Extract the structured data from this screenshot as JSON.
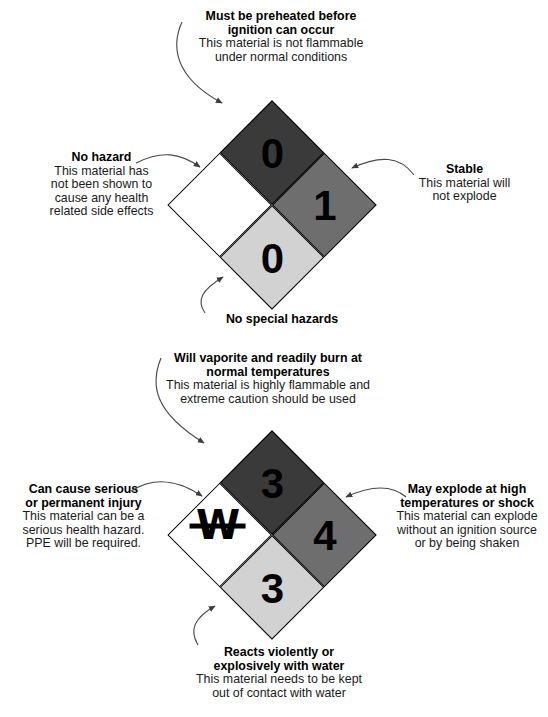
{
  "page": {
    "background_color": "#ffffff",
    "width": 548,
    "height": 717
  },
  "palette": {
    "health_quadrant": "#3a3a3a",
    "flammability_quadrant": "#6e6e6e",
    "reactivity_quadrant": "#d2d2d2",
    "special_quadrant": "#ffffff",
    "border": "#000000",
    "rating_text": "#000000",
    "body_text": "#1a1a1a",
    "arrow_stroke": "#4a4a4a"
  },
  "diagrams": [
    {
      "id": "diamond-upper",
      "name": "low-hazard-example",
      "quadrants": {
        "flammability": {
          "rating": "1",
          "color": "#6e6e6e",
          "position": "top"
        },
        "health": {
          "rating": "0",
          "color": "#3a3a3a",
          "position": "left"
        },
        "reactivity": {
          "rating": "0",
          "color": "#d2d2d2",
          "position": "right"
        },
        "special": {
          "symbol": "",
          "color": "#ffffff",
          "position": "bottom"
        }
      },
      "callouts": {
        "top": {
          "headline": [
            "Must be preheated before",
            "ignition can occur"
          ],
          "description": [
            "This material is not flammable",
            "under normal conditions"
          ]
        },
        "left": {
          "headline": [
            "No hazard"
          ],
          "description": [
            "This material has",
            "not been shown to",
            "cause any health",
            "related side effects"
          ]
        },
        "right": {
          "headline": [
            "Stable"
          ],
          "description": [
            "This material will",
            "not explode"
          ]
        },
        "bottom": {
          "headline": [
            "No special hazards"
          ],
          "description": []
        }
      }
    },
    {
      "id": "diamond-lower",
      "name": "high-hazard-example",
      "quadrants": {
        "flammability": {
          "rating": "4",
          "color": "#6e6e6e",
          "position": "top"
        },
        "health": {
          "rating": "3",
          "color": "#3a3a3a",
          "position": "left"
        },
        "reactivity": {
          "rating": "3",
          "color": "#d2d2d2",
          "position": "right"
        },
        "special": {
          "symbol": "W",
          "color": "#ffffff",
          "position": "bottom",
          "struck_through": true
        }
      },
      "callouts": {
        "top": {
          "headline": [
            "Will vaporite and readily burn at",
            "normal temperatures"
          ],
          "description": [
            "This material is highly flammable and",
            "extreme caution should be used"
          ]
        },
        "left": {
          "headline": [
            "Can cause serious",
            "or permanent injury"
          ],
          "description": [
            "This material can be a",
            "serious health hazard.",
            "PPE will be required."
          ]
        },
        "right": {
          "headline": [
            "May explode at high",
            "temperatures or shock"
          ],
          "description": [
            "This material can explode",
            "without an ignition source",
            "or by being shaken"
          ]
        },
        "bottom": {
          "headline": [
            "Reacts violently or",
            "explosively with water"
          ],
          "description": [
            "This material needs to be kept",
            "out of contact with water"
          ]
        }
      }
    }
  ]
}
